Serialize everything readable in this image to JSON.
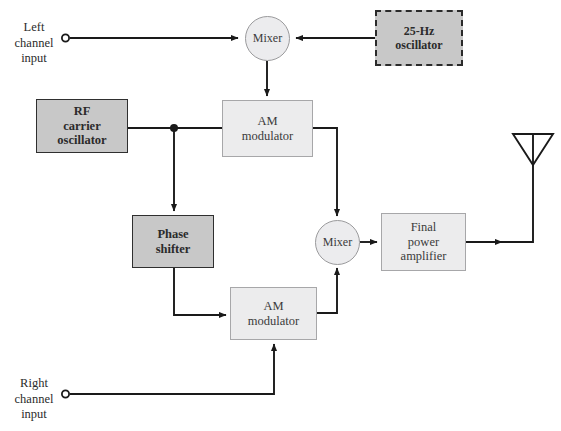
{
  "diagram": {
    "colors": {
      "dark_block_fill": "#c8c8c8",
      "light_block_fill": "#ececed",
      "dark_border": "#2f2f2f",
      "light_border": "#a7a7a9",
      "wire": "#1a1a1a",
      "background": "#ffffff"
    },
    "inputs": [
      {
        "id": "left_input",
        "label": "Left\nchannel\ninput"
      },
      {
        "id": "right_input",
        "label": "Right\nchannel\ninput"
      }
    ],
    "blocks": [
      {
        "id": "mixer_top",
        "label": "Mixer",
        "shape": "circle",
        "style": "light"
      },
      {
        "id": "osc_25hz",
        "label": "25-Hz\noscillator",
        "shape": "rect",
        "style": "dashed"
      },
      {
        "id": "rf_carrier",
        "label": "RF\ncarrier\noscillator",
        "shape": "rect",
        "style": "dark"
      },
      {
        "id": "am_mod_top",
        "label": "AM\nmodulator",
        "shape": "rect",
        "style": "light"
      },
      {
        "id": "phase_shifter",
        "label": "Phase\nshifter",
        "shape": "rect",
        "style": "dark"
      },
      {
        "id": "mixer_bottom",
        "label": "Mixer",
        "shape": "circle",
        "style": "light"
      },
      {
        "id": "final_amp",
        "label": "Final\npower\namplifier",
        "shape": "rect",
        "style": "light"
      },
      {
        "id": "am_mod_bottom",
        "label": "AM\nmodulator",
        "shape": "rect",
        "style": "light"
      },
      {
        "id": "antenna",
        "label": "",
        "shape": "antenna",
        "style": "line"
      }
    ]
  }
}
